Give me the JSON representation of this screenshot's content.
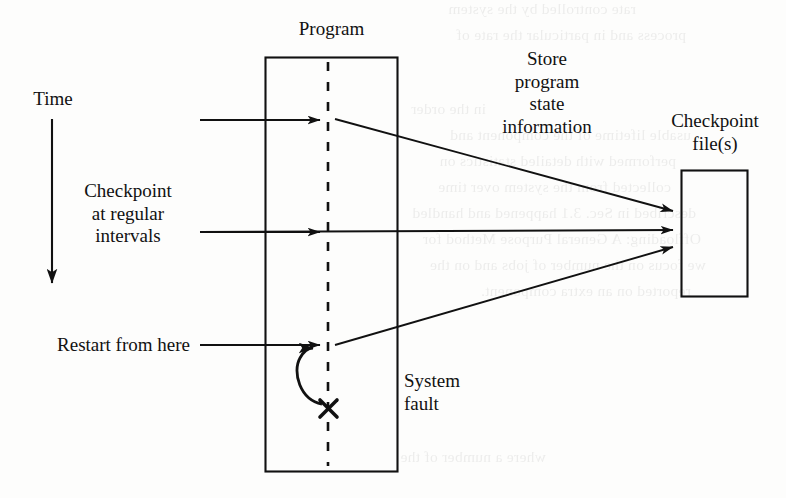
{
  "figure": {
    "type": "checkpoint-restart diagram",
    "labels": {
      "time": "Time",
      "program": "Program",
      "checkpoint_interval": "Checkpoint\nat regular\nintervals",
      "store_state": "Store\nprogram\nstate\ninformation",
      "checkpoint_files": "Checkpoint\nfile(s)",
      "restart": "Restart from here",
      "system_fault": "System\nfault",
      "fault_marker": "✕"
    },
    "colors": {
      "ink": "#111111",
      "page": "#fdfdfc"
    },
    "boxes": [
      {
        "name": "program",
        "x": 265,
        "y": 57,
        "w": 133,
        "h": 415
      },
      {
        "name": "checkpoint-files",
        "x": 681,
        "y": 170,
        "w": 67,
        "h": 127
      }
    ],
    "lifeline": {
      "x": 328,
      "y1": 62,
      "y2": 466,
      "style": "dashed"
    },
    "time_axis": {
      "x": 52,
      "y1": 120,
      "y2": 290,
      "direction": "down"
    },
    "arrows": [
      {
        "name": "checkpoint-1",
        "from": [
          200,
          120
        ],
        "to": [
          328,
          120
        ]
      },
      {
        "name": "checkpoint-2",
        "from": [
          200,
          232
        ],
        "to": [
          328,
          232
        ]
      },
      {
        "name": "restart",
        "from": [
          200,
          345
        ],
        "to": [
          328,
          345
        ]
      },
      {
        "name": "store-state-1",
        "from": [
          335,
          120
        ],
        "to": [
          681,
          213
        ]
      },
      {
        "name": "store-state-2",
        "from": [
          335,
          232
        ],
        "to": [
          681,
          229
        ]
      },
      {
        "name": "restore-state",
        "from": [
          335,
          345
        ],
        "to": [
          681,
          245
        ]
      },
      {
        "name": "rollback-curve",
        "from": [
          322,
          405
        ],
        "to": [
          318,
          350
        ]
      }
    ]
  },
  "bleed_text": [
    {
      "x": 150,
      "y": -4,
      "t": "rate controlled by the system"
    },
    {
      "x": 100,
      "y": 22,
      "t": "process and in particular the rate of"
    },
    {
      "x": 300,
      "y": 96,
      "t": "in the order"
    },
    {
      "x": 95,
      "y": 122,
      "t": "usable lifetime of the component and"
    },
    {
      "x": 110,
      "y": 148,
      "t": "performed with detailed statistics on"
    },
    {
      "x": 115,
      "y": 174,
      "t": "collected from the system over time"
    },
    {
      "x": 90,
      "y": 200,
      "t": "described in Sec. 3.1 happened and handled"
    },
    {
      "x": 85,
      "y": 226,
      "t": "Offloading: A General Purpose Method for"
    },
    {
      "x": 80,
      "y": 252,
      "t": "we focus on the number of jobs and on the"
    },
    {
      "x": 95,
      "y": 278,
      "t": "reported on an extra component."
    },
    {
      "x": 240,
      "y": 444,
      "t": "where a number of the"
    }
  ]
}
